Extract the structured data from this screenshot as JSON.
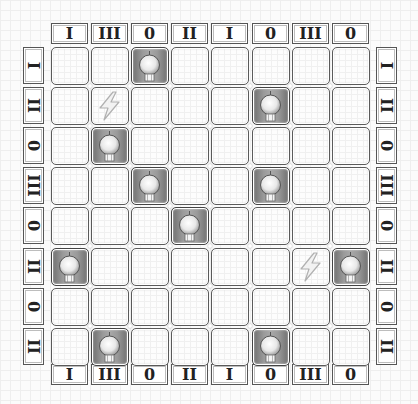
{
  "puzzle": {
    "rows": 8,
    "cols": 8,
    "col_labels_top": [
      "I",
      "III",
      "0",
      "II",
      "I",
      "0",
      "III",
      "0"
    ],
    "col_labels_bottom": [
      "I",
      "III",
      "0",
      "II",
      "I",
      "0",
      "III",
      "0"
    ],
    "row_labels_left": [
      "I",
      "II",
      "0",
      "III",
      "0",
      "II",
      "0",
      "II"
    ],
    "row_labels_right": [
      "I",
      "II",
      "0",
      "III",
      "0",
      "II",
      "0",
      "II"
    ],
    "grid": [
      [
        ".",
        ".",
        "B",
        ".",
        ".",
        ".",
        ".",
        "."
      ],
      [
        ".",
        "Z",
        ".",
        ".",
        ".",
        "B",
        ".",
        "."
      ],
      [
        ".",
        "B",
        ".",
        ".",
        ".",
        ".",
        ".",
        "."
      ],
      [
        ".",
        ".",
        "B",
        ".",
        ".",
        "B",
        ".",
        "."
      ],
      [
        ".",
        ".",
        ".",
        "B",
        ".",
        ".",
        ".",
        "."
      ],
      [
        "B",
        ".",
        ".",
        ".",
        ".",
        ".",
        "Z",
        "B"
      ],
      [
        ".",
        ".",
        ".",
        ".",
        ".",
        ".",
        ".",
        "."
      ],
      [
        ".",
        "B",
        ".",
        ".",
        ".",
        "B",
        ".",
        "."
      ]
    ],
    "legend": {
      "B": "lightbulb-icon",
      "Z": "lightning-bolt-icon",
      ".": "empty"
    }
  }
}
